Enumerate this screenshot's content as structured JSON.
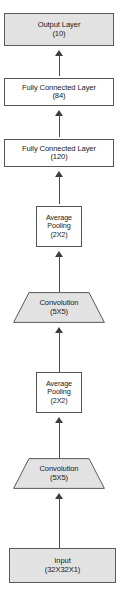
{
  "diagram": {
    "orientation": "bottom-to-top",
    "accent_shaded": "#e2e2e2",
    "accent_plain": "#ffffff",
    "stroke": "#555555",
    "arrow_color": "#4a4a4a",
    "nodes": [
      {
        "id": "output-layer",
        "label": "Output Layer",
        "sub": "(10)",
        "shape": "rectangle",
        "fill": "shaded"
      },
      {
        "id": "fully-connected-84",
        "label": "Fully Connected Layer",
        "sub": "(84)",
        "shape": "rectangle",
        "fill": "plain"
      },
      {
        "id": "fully-connected-120",
        "label": "Fully Connected Layer",
        "sub": "(120)",
        "shape": "rectangle",
        "fill": "plain"
      },
      {
        "id": "average-pooling-2",
        "label": "Average",
        "label2": "Pooling",
        "sub": "(2X2)",
        "shape": "rectangle",
        "fill": "plain"
      },
      {
        "id": "convolution-2",
        "label": "Convolution",
        "sub": "(5X5)",
        "shape": "trapezoid",
        "fill": "shaded"
      },
      {
        "id": "average-pooling-1",
        "label": "Average",
        "label2": "Pooling",
        "sub": "(2X2)",
        "shape": "rectangle",
        "fill": "plain"
      },
      {
        "id": "convolution-1",
        "label": "Convolution",
        "sub": "(5X5)",
        "shape": "trapezoid",
        "fill": "shaded"
      },
      {
        "id": "input",
        "label": "Input",
        "sub": "(32X32X1)",
        "shape": "rectangle",
        "fill": "shaded"
      }
    ],
    "edges": [
      {
        "id": "edge-input-to-conv1",
        "from": "input",
        "to": "convolution-1",
        "marker": "arrowhead-up"
      },
      {
        "id": "edge-conv1-to-pool1",
        "from": "convolution-1",
        "to": "average-pooling-1",
        "marker": "arrowhead-up"
      },
      {
        "id": "edge-pool1-to-conv2",
        "from": "average-pooling-1",
        "to": "convolution-2",
        "marker": "arrowhead-up"
      },
      {
        "id": "edge-conv2-to-pool2",
        "from": "convolution-2",
        "to": "average-pooling-2",
        "marker": "arrowhead-up"
      },
      {
        "id": "edge-pool2-to-fc120",
        "from": "average-pooling-2",
        "to": "fully-connected-120",
        "marker": "arrowhead-up"
      },
      {
        "id": "edge-fc120-to-fc84",
        "from": "fully-connected-120",
        "to": "fully-connected-84",
        "marker": "arrowhead-up"
      },
      {
        "id": "edge-fc84-to-output",
        "from": "fully-connected-84",
        "to": "output-layer",
        "marker": "arrowhead-up"
      }
    ]
  }
}
